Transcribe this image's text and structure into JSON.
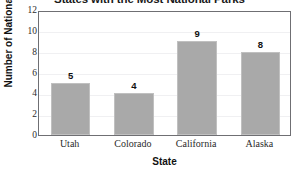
{
  "chart_data": {
    "type": "bar",
    "title": "States with the Most National Parks",
    "xlabel": "State",
    "ylabel": "Number of National Parks",
    "categories": [
      "Utah",
      "Colorado",
      "California",
      "Alaska"
    ],
    "values": [
      5,
      4,
      9,
      8
    ],
    "value_labels": [
      "5",
      "4",
      "9",
      "8"
    ],
    "ylim": [
      0,
      12
    ],
    "yticks": [
      0,
      2,
      4,
      6,
      8,
      10,
      12
    ],
    "ytick_labels": [
      "0",
      "2",
      "4",
      "6",
      "8",
      "10",
      "12"
    ],
    "grid": true,
    "grid_axis": "y",
    "legend": false,
    "bar_color": "#a9a9a9",
    "bar_edge_color": "#c0c0c0",
    "frame_color": "#6f6f73",
    "gridline_color": "#f0f0f2",
    "background": "#ffffff"
  }
}
